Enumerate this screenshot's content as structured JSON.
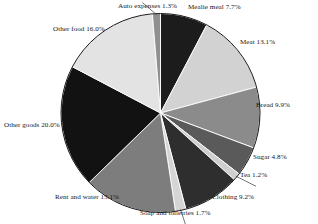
{
  "chart_data": {
    "type": "pie",
    "title": "",
    "subtitle": "",
    "xlabel": "",
    "ylabel": "",
    "unit": "%",
    "legend_position": "none",
    "labels_position": "outside-radial",
    "grid": false,
    "start_angle_deg": 0,
    "direction": "clockwise",
    "total": 100.0,
    "categories": [
      "Mealie meal",
      "Meat",
      "Bread",
      "Sugar",
      "Tea",
      "Clothing",
      "Soap and toiletries",
      "Rent and water",
      "Other goods",
      "Other food",
      "Auto expenses"
    ],
    "values": [
      7.7,
      13.1,
      9.9,
      4.8,
      1.2,
      9.2,
      1.7,
      15.1,
      20.0,
      16.0,
      1.3
    ],
    "colors": [
      "#1c1c1c",
      "#d2d2d2",
      "#8b8b8b",
      "#5a5a5a",
      "#cfcfcf",
      "#2e2e2e",
      "#d5d5d5",
      "#7d7d7d",
      "#121212",
      "#e3e3e3",
      "#909090"
    ],
    "slices": [
      {
        "label": "Mealie meal",
        "value": 7.7,
        "text": "Mealie meal 7.7%",
        "color": "#1c1c1c"
      },
      {
        "label": "Meat",
        "value": 13.1,
        "text": "Meat 13.1%",
        "color": "#d2d2d2"
      },
      {
        "label": "Bread",
        "value": 9.9,
        "text": "Bread 9.9%",
        "color": "#8b8b8b"
      },
      {
        "label": "Sugar",
        "value": 4.8,
        "text": "Sugar 4.8%",
        "color": "#5a5a5a"
      },
      {
        "label": "Tea",
        "value": 1.2,
        "text": "Tea 1.2%",
        "color": "#cfcfcf"
      },
      {
        "label": "Clothing",
        "value": 9.2,
        "text": "Clothing 9.2%",
        "color": "#2e2e2e"
      },
      {
        "label": "Soap and toiletries",
        "value": 1.7,
        "text": "Soap and toiletries 1.7%",
        "color": "#d5d5d5"
      },
      {
        "label": "Rent and water",
        "value": 15.1,
        "text": "Rent and water 15.1%",
        "color": "#7d7d7d"
      },
      {
        "label": "Other goods",
        "value": 20.0,
        "text": "Other goods 20.0%",
        "color": "#121212"
      },
      {
        "label": "Other food",
        "value": 16.0,
        "text": "Other food 16.0%",
        "color": "#e3e3e3"
      },
      {
        "label": "Auto expenses",
        "value": 1.3,
        "text": "Auto expenses 1.3%",
        "color": "#909090"
      }
    ]
  },
  "figure": {
    "background": "#ffffff",
    "outline_color": "#1a1a1a",
    "label_color": "#181818"
  }
}
